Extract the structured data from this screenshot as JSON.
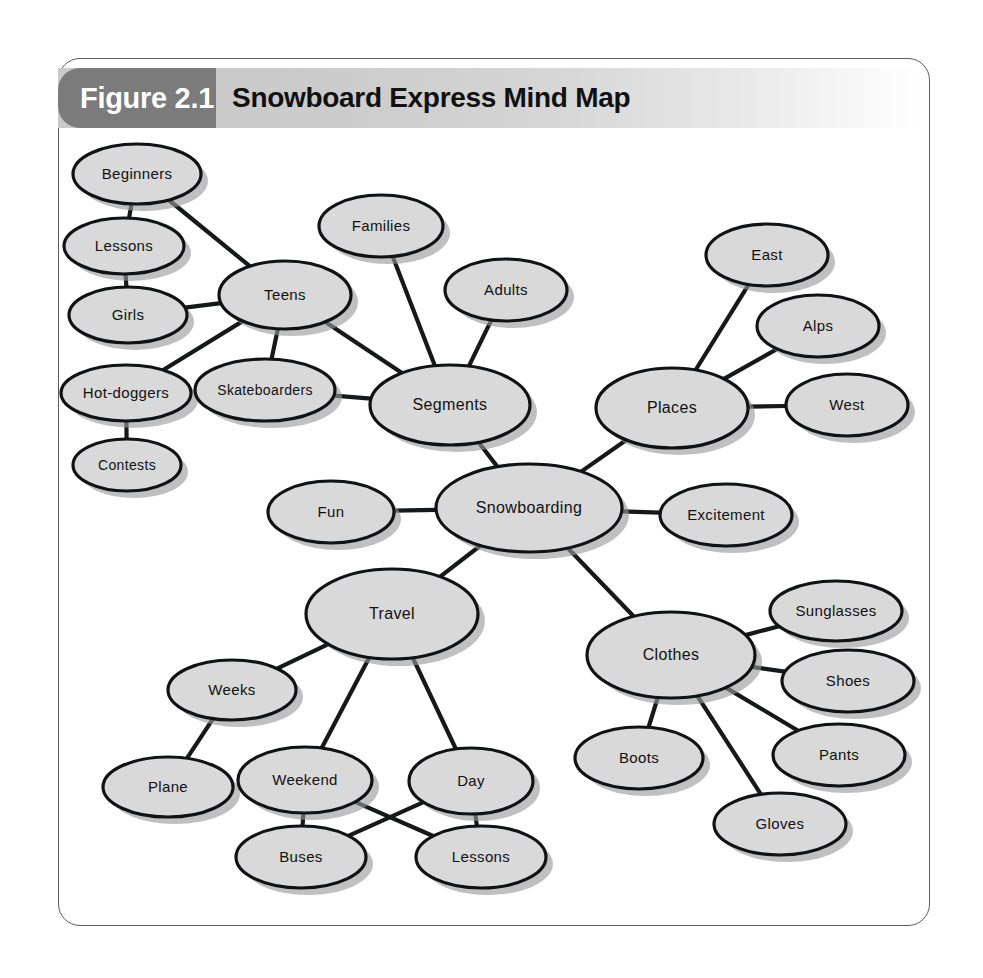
{
  "figure": {
    "badge_label": "Figure 2.1",
    "title": "Snowboard Express Mind Map",
    "badge_color": "#7b7b7b",
    "band_color": "#cbcbcb",
    "frame_border_color": "#5c5c5c",
    "node_fill_color": "#d9d9d9",
    "node_stroke_color": "#101214",
    "edge_color": "#16181a",
    "shadow_color": "#9a9a9a"
  },
  "chart_data": {
    "type": "diagram",
    "diagram_type": "mind-map",
    "title": "Snowboard Express Mind Map",
    "root": "Snowboarding",
    "nodes": [
      {
        "id": "snowboarding",
        "label": "Snowboarding",
        "cx": 471,
        "cy": 378,
        "rx": 93,
        "ry": 44,
        "font": 16
      },
      {
        "id": "segments",
        "label": "Segments",
        "cx": 392,
        "cy": 275,
        "rx": 80,
        "ry": 40,
        "font": 16
      },
      {
        "id": "families",
        "label": "Families",
        "cx": 323,
        "cy": 96,
        "rx": 62,
        "ry": 31,
        "font": 15
      },
      {
        "id": "adults",
        "label": "Adults",
        "cx": 448,
        "cy": 160,
        "rx": 61,
        "ry": 31,
        "font": 15
      },
      {
        "id": "teens",
        "label": "Teens",
        "cx": 227,
        "cy": 165,
        "rx": 66,
        "ry": 34,
        "font": 15
      },
      {
        "id": "skateboarders",
        "label": "Skateboarders",
        "cx": 207,
        "cy": 260,
        "rx": 70,
        "ry": 31,
        "font": 14
      },
      {
        "id": "beginners",
        "label": "Beginners",
        "cx": 79,
        "cy": 44,
        "rx": 64,
        "ry": 30,
        "font": 15
      },
      {
        "id": "lessons_left",
        "label": "Lessons",
        "cx": 66,
        "cy": 116,
        "rx": 60,
        "ry": 28,
        "font": 15
      },
      {
        "id": "girls",
        "label": "Girls",
        "cx": 70,
        "cy": 185,
        "rx": 59,
        "ry": 28,
        "font": 15
      },
      {
        "id": "hot_doggers",
        "label": "Hot-doggers",
        "cx": 68,
        "cy": 263,
        "rx": 65,
        "ry": 28,
        "font": 15
      },
      {
        "id": "contests",
        "label": "Contests",
        "cx": 69,
        "cy": 335,
        "rx": 54,
        "ry": 26,
        "font": 14
      },
      {
        "id": "places",
        "label": "Places",
        "cx": 614,
        "cy": 278,
        "rx": 76,
        "ry": 40,
        "font": 16
      },
      {
        "id": "east",
        "label": "East",
        "cx": 709,
        "cy": 125,
        "rx": 61,
        "ry": 31,
        "font": 15
      },
      {
        "id": "alps",
        "label": "Alps",
        "cx": 760,
        "cy": 196,
        "rx": 61,
        "ry": 31,
        "font": 15
      },
      {
        "id": "west",
        "label": "West",
        "cx": 789,
        "cy": 275,
        "rx": 61,
        "ry": 31,
        "font": 15
      },
      {
        "id": "excitement",
        "label": "Excitement",
        "cx": 668,
        "cy": 385,
        "rx": 66,
        "ry": 31,
        "font": 15
      },
      {
        "id": "fun",
        "label": "Fun",
        "cx": 273,
        "cy": 382,
        "rx": 63,
        "ry": 31,
        "font": 15
      },
      {
        "id": "travel",
        "label": "Travel",
        "cx": 334,
        "cy": 484,
        "rx": 86,
        "ry": 45,
        "font": 16
      },
      {
        "id": "weeks",
        "label": "Weeks",
        "cx": 174,
        "cy": 560,
        "rx": 64,
        "ry": 30,
        "font": 15
      },
      {
        "id": "plane",
        "label": "Plane",
        "cx": 110,
        "cy": 657,
        "rx": 65,
        "ry": 30,
        "font": 15
      },
      {
        "id": "weekend",
        "label": "Weekend",
        "cx": 247,
        "cy": 650,
        "rx": 67,
        "ry": 33,
        "font": 15
      },
      {
        "id": "day",
        "label": "Day",
        "cx": 413,
        "cy": 651,
        "rx": 62,
        "ry": 33,
        "font": 15
      },
      {
        "id": "buses",
        "label": "Buses",
        "cx": 243,
        "cy": 727,
        "rx": 65,
        "ry": 31,
        "font": 15
      },
      {
        "id": "lessons_bot",
        "label": "Lessons",
        "cx": 423,
        "cy": 727,
        "rx": 65,
        "ry": 31,
        "font": 15
      },
      {
        "id": "clothes",
        "label": "Clothes",
        "cx": 613,
        "cy": 525,
        "rx": 84,
        "ry": 43,
        "font": 16
      },
      {
        "id": "sunglasses",
        "label": "Sunglasses",
        "cx": 778,
        "cy": 481,
        "rx": 66,
        "ry": 30,
        "font": 15
      },
      {
        "id": "shoes",
        "label": "Shoes",
        "cx": 790,
        "cy": 551,
        "rx": 66,
        "ry": 31,
        "font": 15
      },
      {
        "id": "pants",
        "label": "Pants",
        "cx": 781,
        "cy": 625,
        "rx": 66,
        "ry": 31,
        "font": 15
      },
      {
        "id": "gloves",
        "label": "Gloves",
        "cx": 722,
        "cy": 694,
        "rx": 66,
        "ry": 31,
        "font": 15
      },
      {
        "id": "boots",
        "label": "Boots",
        "cx": 581,
        "cy": 628,
        "rx": 64,
        "ry": 31,
        "font": 15
      }
    ],
    "edges": [
      {
        "from": "snowboarding",
        "to": "segments"
      },
      {
        "from": "snowboarding",
        "to": "places"
      },
      {
        "from": "snowboarding",
        "to": "excitement"
      },
      {
        "from": "snowboarding",
        "to": "fun"
      },
      {
        "from": "snowboarding",
        "to": "travel"
      },
      {
        "from": "snowboarding",
        "to": "clothes"
      },
      {
        "from": "segments",
        "to": "families"
      },
      {
        "from": "segments",
        "to": "adults"
      },
      {
        "from": "segments",
        "to": "teens"
      },
      {
        "from": "segments",
        "to": "skateboarders"
      },
      {
        "from": "teens",
        "to": "skateboarders"
      },
      {
        "from": "teens",
        "to": "beginners"
      },
      {
        "from": "teens",
        "to": "girls"
      },
      {
        "from": "teens",
        "to": "hot_doggers"
      },
      {
        "from": "beginners",
        "to": "lessons_left"
      },
      {
        "from": "lessons_left",
        "to": "girls"
      },
      {
        "from": "hot_doggers",
        "to": "contests"
      },
      {
        "from": "places",
        "to": "east"
      },
      {
        "from": "places",
        "to": "alps"
      },
      {
        "from": "places",
        "to": "west"
      },
      {
        "from": "travel",
        "to": "weeks"
      },
      {
        "from": "weeks",
        "to": "plane"
      },
      {
        "from": "travel",
        "to": "weekend"
      },
      {
        "from": "travel",
        "to": "day"
      },
      {
        "from": "weekend",
        "to": "buses"
      },
      {
        "from": "weekend",
        "to": "lessons_bot"
      },
      {
        "from": "day",
        "to": "buses"
      },
      {
        "from": "day",
        "to": "lessons_bot"
      },
      {
        "from": "clothes",
        "to": "sunglasses"
      },
      {
        "from": "clothes",
        "to": "shoes"
      },
      {
        "from": "clothes",
        "to": "pants"
      },
      {
        "from": "clothes",
        "to": "gloves"
      },
      {
        "from": "clothes",
        "to": "boots"
      }
    ]
  }
}
